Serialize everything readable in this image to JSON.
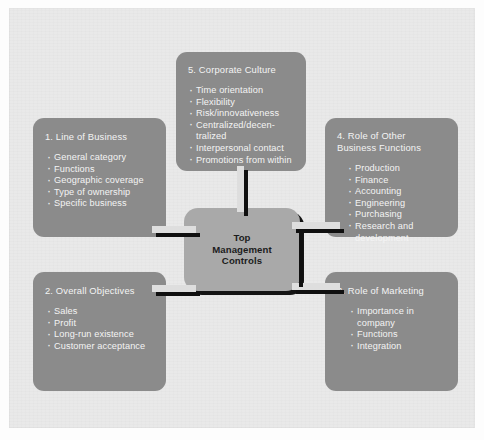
{
  "diagram": {
    "type": "hub-and-spoke",
    "center": {
      "label": "Top\nManagement\nControls",
      "color": "#a9a9a9",
      "text_color": "#1c1c1c"
    },
    "node_color": "#8b8b8b",
    "node_text_color": "#f4f4f4",
    "panel_color": "#e9e9e9",
    "connector_color": "#dedede",
    "connector_shadow_color": "#101010",
    "nodes": [
      {
        "id": "line-of-business",
        "title": "1. Line of Business",
        "items": [
          "General category",
          "Functions",
          "Geographic coverage",
          "Type of ownership",
          "Specific business"
        ]
      },
      {
        "id": "overall-objectives",
        "title": "2. Overall Objectives",
        "items": [
          "Sales",
          "Profit",
          "Long-run existence",
          "Customer acceptance"
        ]
      },
      {
        "id": "role-of-marketing",
        "title": "3. Role of Marketing",
        "items": [
          "Importance in\n  company",
          "Functions",
          "Integration"
        ]
      },
      {
        "id": "role-of-other-business-functions",
        "title": "4. Role of Other\n    Business Functions",
        "items": [
          "Production",
          "Finance",
          "Accounting",
          "Engineering",
          "Purchasing",
          "Research and\n  development"
        ]
      },
      {
        "id": "corporate-culture",
        "title": "5. Corporate Culture",
        "items": [
          "Time orientation",
          "Flexibility",
          "Risk/innovativeness",
          "Centralized/decen-\n   tralized",
          "Interpersonal contact",
          "Promotions from within"
        ]
      }
    ]
  }
}
